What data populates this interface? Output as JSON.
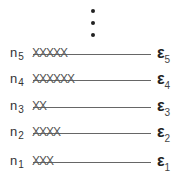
{
  "diagram": {
    "ellipsis_dots": 3,
    "levels": [
      {
        "n_label": "n",
        "n_sub": "5",
        "x_count": 5,
        "xs": "XXXXX",
        "e_label": "ε",
        "e_sub": "5"
      },
      {
        "n_label": "n",
        "n_sub": "4",
        "x_count": 6,
        "xs": "XXXXXX",
        "e_label": "ε",
        "e_sub": "4"
      },
      {
        "n_label": "n",
        "n_sub": "3",
        "x_count": 2,
        "xs": "XX",
        "e_label": "ε",
        "e_sub": "3"
      },
      {
        "n_label": "n",
        "n_sub": "2",
        "x_count": 4,
        "xs": "XXXX",
        "e_label": "ε",
        "e_sub": "2"
      },
      {
        "n_label": "n",
        "n_sub": "1",
        "x_count": 3,
        "xs": "XXX",
        "e_label": "ε",
        "e_sub": "1"
      }
    ]
  }
}
